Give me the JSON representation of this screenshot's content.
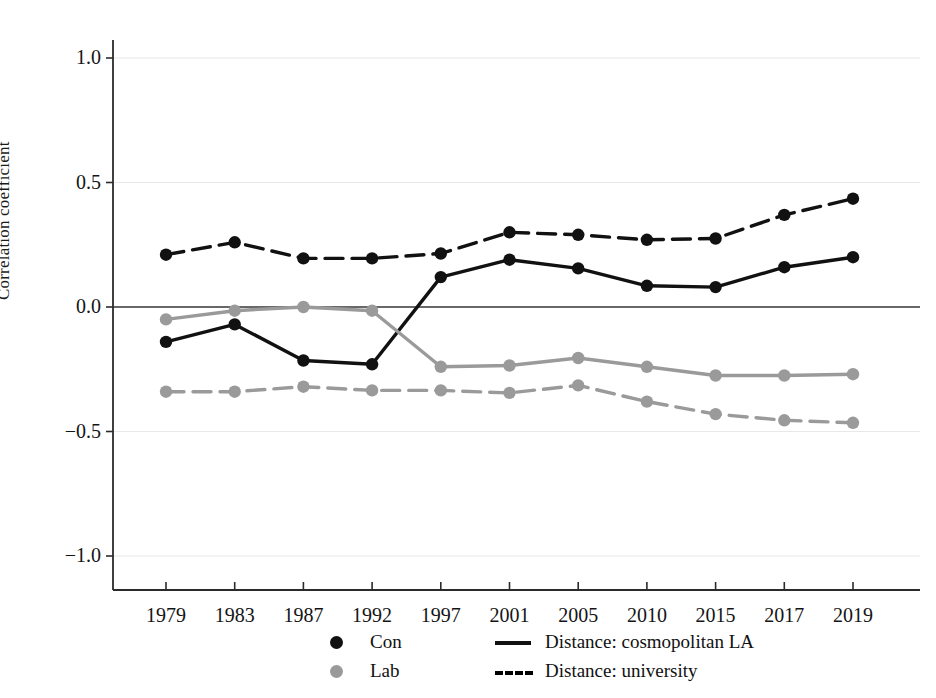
{
  "chart_data": {
    "type": "line",
    "title": "",
    "xlabel": "",
    "ylabel": "Correlation coefficient",
    "categories": [
      "1979",
      "1983",
      "1987",
      "1992",
      "1997",
      "2001",
      "2005",
      "2010",
      "2015",
      "2017",
      "2019"
    ],
    "ylim": [
      -1.25,
      1.15
    ],
    "yticks": [
      1.0,
      0.5,
      0.0,
      -0.5,
      -1.0
    ],
    "ytick_labels": [
      "1.0",
      "0.5",
      "0.0",
      "-0.5",
      "-1.0"
    ],
    "grid": true,
    "grid_axis": "y",
    "zero_line": true,
    "legend_position": "bottom",
    "series": [
      {
        "name": "Con",
        "legend_kind": "marker",
        "color": "#111111",
        "linestyle": "solid",
        "values": [
          -0.14,
          -0.07,
          -0.215,
          -0.23,
          0.12,
          0.19,
          0.155,
          0.085,
          0.08,
          0.16,
          0.2
        ]
      },
      {
        "name": "Lab",
        "legend_kind": "marker",
        "color": "#9a9a9a",
        "linestyle": "solid",
        "values": [
          -0.05,
          -0.015,
          0.0,
          -0.015,
          -0.24,
          -0.235,
          -0.205,
          -0.24,
          -0.275,
          -0.275,
          -0.27
        ]
      },
      {
        "name": "Distance: cosmopolitan LA",
        "legend_kind": "line",
        "color": "#111111",
        "linestyle": "dashed",
        "values": [
          0.21,
          0.26,
          0.195,
          0.195,
          0.215,
          0.3,
          0.29,
          0.27,
          0.275,
          0.37,
          0.435
        ]
      },
      {
        "name": "Distance: university",
        "legend_kind": "dashed-line",
        "color": "#9a9a9a",
        "linestyle": "dashed",
        "values": [
          -0.34,
          -0.34,
          -0.32,
          -0.335,
          -0.335,
          -0.345,
          -0.315,
          -0.38,
          -0.43,
          -0.455,
          -0.465
        ]
      }
    ],
    "legend_entries": [
      {
        "label": "Con",
        "kind": "marker",
        "color": "#111111"
      },
      {
        "label": "Lab",
        "kind": "marker",
        "color": "#9a9a9a"
      },
      {
        "label": "Distance: cosmopolitan LA",
        "kind": "solid-line",
        "color": "#111111"
      },
      {
        "label": "Distance: university",
        "kind": "dashed-line",
        "color": "#111111"
      }
    ]
  },
  "colors": {
    "con": "#111111",
    "lab": "#9a9a9a",
    "grid": "#e8e8e8",
    "axis": "#2b2b2b",
    "background": "#ffffff"
  }
}
